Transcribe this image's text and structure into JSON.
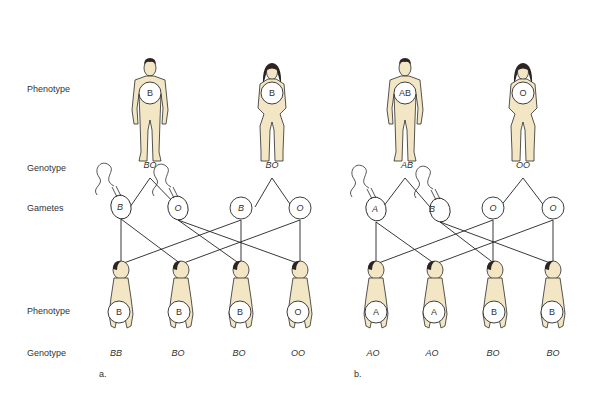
{
  "row_labels": {
    "parent_phenotype": "Phenotype",
    "parent_genotype": "Genotype",
    "gametes": "Gametes",
    "child_phenotype": "Phenotype",
    "child_genotype": "Genotype"
  },
  "panels": [
    {
      "label": "a.",
      "parents": [
        {
          "sex": "male",
          "phenotype": "B",
          "genotype": "BO"
        },
        {
          "sex": "female",
          "phenotype": "B",
          "genotype": "BO"
        }
      ],
      "gametes": [
        {
          "allele": "B",
          "type": "sperm"
        },
        {
          "allele": "O",
          "type": "sperm"
        },
        {
          "allele": "B",
          "type": "egg"
        },
        {
          "allele": "O",
          "type": "egg"
        }
      ],
      "children": [
        {
          "phenotype": "B",
          "genotype": "BB"
        },
        {
          "phenotype": "B",
          "genotype": "BO"
        },
        {
          "phenotype": "B",
          "genotype": "BO"
        },
        {
          "phenotype": "O",
          "genotype": "OO"
        }
      ]
    },
    {
      "label": "b.",
      "parents": [
        {
          "sex": "male",
          "phenotype": "AB",
          "genotype": "AB"
        },
        {
          "sex": "female",
          "phenotype": "O",
          "genotype": "OO"
        }
      ],
      "gametes": [
        {
          "allele": "A",
          "type": "sperm"
        },
        {
          "allele": "B",
          "type": "sperm"
        },
        {
          "allele": "O",
          "type": "egg"
        },
        {
          "allele": "O",
          "type": "egg"
        }
      ],
      "children": [
        {
          "phenotype": "A",
          "genotype": "AO"
        },
        {
          "phenotype": "A",
          "genotype": "AO"
        },
        {
          "phenotype": "B",
          "genotype": "BO"
        },
        {
          "phenotype": "B",
          "genotype": "BO"
        }
      ]
    }
  ],
  "colors": {
    "skin": "#f3e6c4",
    "outline": "#2a2a2a",
    "hair": "#2b2420",
    "line": "#222222"
  }
}
